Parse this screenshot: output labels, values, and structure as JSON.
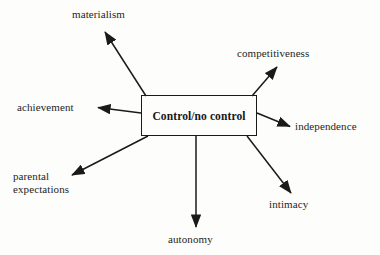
{
  "diagram": {
    "type": "concept-map",
    "title": "Control/no control",
    "center": {
      "label": "Control/no control",
      "shape": "rectangle",
      "x": 141,
      "y": 95,
      "width": 116,
      "height": 41
    },
    "background_color": "#fdfdfc",
    "line_color": "#1a1a1a",
    "text_color": "#1d1d1d",
    "nodes": [
      {
        "id": "materialism",
        "label": "materialism",
        "direction": "up-left",
        "arrow_from": [
          146,
          96
        ],
        "arrow_to": [
          104,
          31
        ]
      },
      {
        "id": "competitiveness",
        "label": "competitiveness",
        "direction": "up-right",
        "arrow_from": [
          252,
          96
        ],
        "arrow_to": [
          278,
          66
        ]
      },
      {
        "id": "achievement",
        "label": "achievement",
        "direction": "left",
        "arrow_from": [
          141,
          113
        ],
        "arrow_to": [
          96,
          107
        ]
      },
      {
        "id": "independence",
        "label": "independence",
        "direction": "right-down",
        "arrow_from": [
          257,
          113
        ],
        "arrow_to": [
          291,
          127
        ]
      },
      {
        "id": "parental-expectations",
        "label": "parental\nexpectations",
        "direction": "down-left",
        "arrow_from": [
          148,
          136
        ],
        "arrow_to": [
          70,
          176
        ]
      },
      {
        "id": "intimacy",
        "label": "intimacy",
        "direction": "down-right",
        "arrow_from": [
          247,
          136
        ],
        "arrow_to": [
          292,
          194
        ]
      },
      {
        "id": "autonomy",
        "label": "autonomy",
        "direction": "down",
        "arrow_from": [
          196,
          136
        ],
        "arrow_to": [
          196,
          228
        ]
      }
    ]
  }
}
